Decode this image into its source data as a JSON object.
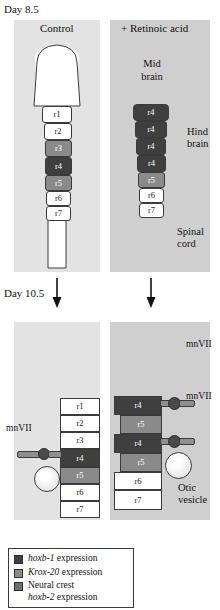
{
  "figure": {
    "type": "biology-schematic"
  },
  "stages": [
    {
      "id": "day8",
      "label": "Day 8.5"
    },
    {
      "id": "day10",
      "label": "Day 10.5"
    }
  ],
  "panels": {
    "top_left": {
      "title": "Control"
    },
    "top_right": {
      "title": "+ Retinoic acid"
    }
  },
  "regions": {
    "midbrain": "Mid\nbrain",
    "midbrain_line1": "Mid",
    "midbrain_line2": "brain",
    "hindbrain_line1": "Hind",
    "hindbrain_line2": "brain",
    "spinalcord_line1": "Spinal",
    "spinalcord_line2": "cord",
    "otic_line1": "Otic",
    "otic_line2": "vesicle"
  },
  "nerve_label": "mnVII",
  "segments": {
    "top_left": [
      "r1",
      "r2",
      "r3",
      "r4",
      "r5",
      "r6",
      "r7"
    ],
    "top_left_shades": [
      "white",
      "white",
      "mid",
      "dark",
      "mid",
      "white",
      "white"
    ],
    "top_right": [
      "r4",
      "r4",
      "r4",
      "r4",
      "r5",
      "r6",
      "r7"
    ],
    "top_right_shades": [
      "dark",
      "dark",
      "dark",
      "dark",
      "mid",
      "white",
      "white"
    ],
    "bottom_left": [
      "r1",
      "r2",
      "r3",
      "r4",
      "r5",
      "r6",
      "r7"
    ],
    "bottom_left_shades": [
      "white",
      "white",
      "white",
      "dark",
      "mid",
      "white",
      "white"
    ],
    "bottom_right": [
      "r4",
      "r5",
      "r4",
      "r5",
      "r6",
      "r7"
    ],
    "bottom_right_shades": [
      "dark",
      "mid",
      "dark",
      "mid",
      "white",
      "white"
    ]
  },
  "legend": {
    "items": [
      {
        "swatch": "#3f3f3f",
        "text_italic": "hoxb-1",
        "text_rest": " expression",
        "line2": ""
      },
      {
        "swatch": "#8a8a8a",
        "text_italic": "Krox-20",
        "text_rest": " expression",
        "line2": ""
      },
      {
        "swatch": "#6e6e78",
        "text_italic": "",
        "text_rest": "Neural crest",
        "line2_italic": "hoxb-2",
        "line2_rest": " expression"
      }
    ]
  },
  "colors": {
    "panel_light": "#e3e3e3",
    "panel_dark": "#cfcfcf",
    "hoxb1": "#3f3f3f",
    "krox20": "#8a8a8a",
    "neural_crest": "#6e6e78",
    "stroke": "#3b3b3b",
    "tube_fill": "#ffffff",
    "nerve": "#8f8f8f",
    "ganglion": "#4a4a4a"
  }
}
